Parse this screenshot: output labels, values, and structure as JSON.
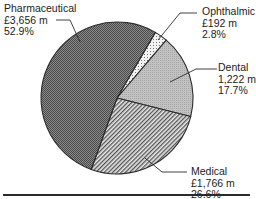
{
  "chart_data": {
    "type": "pie",
    "title": "",
    "start_angle_deg": -59.7,
    "direction": "clockwise",
    "slices": [
      {
        "name": "Ophthalmic",
        "value_label": "£192 m",
        "value": 192,
        "percent_label": "2.8%",
        "percent": 2.8,
        "fill": "ophthalmic"
      },
      {
        "name": "Dental",
        "value_label": "1,222 m",
        "value": 1222,
        "percent_label": "17.7%",
        "percent": 17.7,
        "fill": "dental"
      },
      {
        "name": "Medical",
        "value_label": "£1,766 m",
        "value": 1766,
        "percent_label": "26.6%",
        "percent": 26.6,
        "fill": "medical"
      },
      {
        "name": "Pharmaceutical",
        "value_label": "£3,656 m",
        "value": 3656,
        "percent_label": "52.9%",
        "percent": 52.9,
        "fill": "pharmaceutical"
      }
    ],
    "colors": {
      "outline": "#2b2b2b",
      "pharmaceutical": "#6e6e6e",
      "dental": "#b4b4b4",
      "medical": "#9a9a9a",
      "ophthalmic": "#e8e8e8"
    }
  },
  "labels": {
    "pharmaceutical": {
      "name": "Pharmaceutical",
      "value": "£3,656 m",
      "percent": "52.9%"
    },
    "ophthalmic": {
      "name": "Ophthalmic",
      "value": "£192 m",
      "percent": "2.8%"
    },
    "dental": {
      "name": "Dental",
      "value": "1,222 m",
      "percent": "17.7%"
    },
    "medical": {
      "name": "Medical",
      "value": "£1,766 m",
      "percent": "26.6%"
    }
  }
}
